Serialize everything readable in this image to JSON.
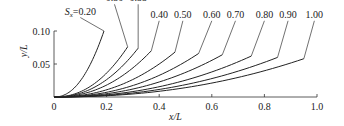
{
  "chart_data": {
    "type": "line",
    "title": "",
    "xlabel": "x/L",
    "ylabel": "y/L",
    "xlim": [
      0,
      1.0
    ],
    "ylim": [
      0,
      0.1
    ],
    "x_ticks": [
      0,
      0.2,
      0.4,
      0.6,
      0.8,
      1.0
    ],
    "x_tick_labels": [
      "0",
      "0.2",
      "0.4",
      "0.6",
      "0.8",
      "1.0"
    ],
    "y_ticks": [
      0.05,
      0.1
    ],
    "y_tick_labels": [
      "0.05",
      "0.10"
    ],
    "origin_label": "0",
    "grid": false,
    "legend_position": "inline labels at curve ends",
    "label_prefix": "S",
    "label_subscript": "x",
    "series": [
      {
        "name": "0.20",
        "x_end": 0.19,
        "y_end": 0.1,
        "label_x": 0.1,
        "label_y": 0.125
      },
      {
        "name": "0.30",
        "x_end": 0.28,
        "y_end": 0.076,
        "label_x": 0.23,
        "label_y": 0.145
      },
      {
        "name": "0.35",
        "x_end": 0.32,
        "y_end": 0.074,
        "label_x": 0.32,
        "label_y": 0.145
      },
      {
        "name": "0.40",
        "x_end": 0.37,
        "y_end": 0.07,
        "label_x": 0.4,
        "label_y": 0.12
      },
      {
        "name": "0.50",
        "x_end": 0.46,
        "y_end": 0.068,
        "label_x": 0.49,
        "label_y": 0.12
      },
      {
        "name": "0.60",
        "x_end": 0.55,
        "y_end": 0.066,
        "label_x": 0.6,
        "label_y": 0.12
      },
      {
        "name": "0.70",
        "x_end": 0.64,
        "y_end": 0.064,
        "label_x": 0.69,
        "label_y": 0.12
      },
      {
        "name": "0.80",
        "x_end": 0.75,
        "y_end": 0.062,
        "label_x": 0.8,
        "label_y": 0.12
      },
      {
        "name": "0.90",
        "x_end": 0.85,
        "y_end": 0.06,
        "label_x": 0.89,
        "label_y": 0.12
      },
      {
        "name": "1.00",
        "x_end": 0.95,
        "y_end": 0.058,
        "label_x": 0.99,
        "label_y": 0.12
      }
    ]
  }
}
